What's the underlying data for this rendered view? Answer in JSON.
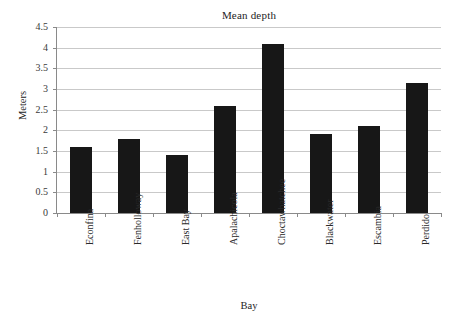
{
  "chart_data": {
    "type": "bar",
    "title": "Mean depth",
    "xlabel": "Bay",
    "ylabel": "Meters",
    "categories": [
      "Econfina",
      "Fenholloway",
      "East Bay",
      "Apalachicola",
      "Choctawhatchee",
      "Blackwater",
      "Escambia",
      "Perdido"
    ],
    "values": [
      1.6,
      1.8,
      1.4,
      2.6,
      4.1,
      1.9,
      2.1,
      3.15
    ],
    "ylim": [
      0,
      4.5
    ],
    "yticks": [
      "0",
      "0.5",
      "1",
      "1.5",
      "2",
      "2.5",
      "3",
      "3.5",
      "4",
      "4.5"
    ],
    "ytick_values": [
      0,
      0.5,
      1,
      1.5,
      2,
      2.5,
      3,
      3.5,
      4,
      4.5
    ],
    "grid": true,
    "legend": "none",
    "bar_color": "#171717",
    "grid_color": "#c9c9c9",
    "axis_color": "#8a8a8a",
    "background": "#ffffff"
  }
}
